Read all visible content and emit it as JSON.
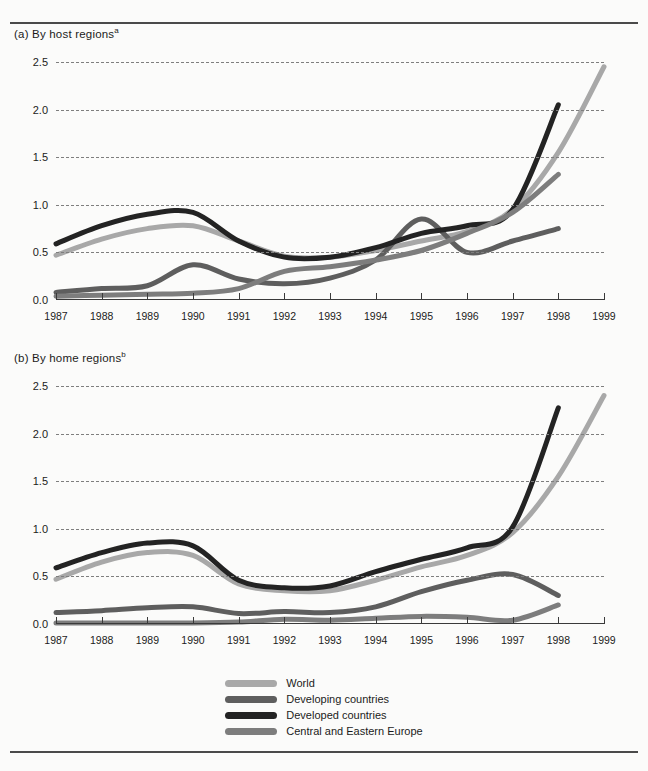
{
  "figure": {
    "background": "#fbfbfa",
    "rule_color": "#4a4a4a"
  },
  "panels": [
    {
      "id": "a",
      "title": "(a) By host regions",
      "note_marker": "a"
    },
    {
      "id": "b",
      "title": "(b) By home regions",
      "note_marker": "b"
    }
  ],
  "legend": {
    "items": [
      {
        "label": "World",
        "color": "#a8a8a8"
      },
      {
        "label": "Developing countries",
        "color": "#5e5e5e"
      },
      {
        "label": "Developed countries",
        "color": "#232323"
      },
      {
        "label": "Central and Eastern Europe",
        "color": "#7d7d7d"
      }
    ]
  },
  "chart_data": [
    {
      "type": "line",
      "panel": "a",
      "title": "(a) By host regions",
      "xlabel": "",
      "ylabel": "",
      "x": [
        1987,
        1988,
        1989,
        1990,
        1991,
        1992,
        1993,
        1994,
        1995,
        1996,
        1997,
        1998,
        1999
      ],
      "xtick_labels": [
        "1987",
        "1988",
        "1989",
        "1990",
        "1991",
        "1992",
        "1993",
        "1994",
        "1995",
        "1996",
        "1997",
        "1998",
        "1999"
      ],
      "ytick_labels": [
        "0.0",
        "0.5",
        "1.0",
        "1.5",
        "2.0",
        "2.5"
      ],
      "yticks": [
        0.0,
        0.5,
        1.0,
        1.5,
        2.0,
        2.5
      ],
      "ylim": [
        0.0,
        2.5
      ],
      "xlim": [
        1987,
        1999
      ],
      "grid": true,
      "legend_position": "bottom-center",
      "series": [
        {
          "name": "World",
          "color": "#a8a8a8",
          "x": [
            1987,
            1988,
            1989,
            1990,
            1991,
            1992,
            1993,
            1994,
            1995,
            1996,
            1997,
            1998,
            1999
          ],
          "values": [
            0.47,
            0.64,
            0.75,
            0.78,
            0.62,
            0.46,
            0.45,
            0.52,
            0.62,
            0.72,
            0.95,
            1.55,
            2.45
          ]
        },
        {
          "name": "Developing countries",
          "color": "#5e5e5e",
          "x": [
            1987,
            1988,
            1989,
            1990,
            1991,
            1992,
            1993,
            1994,
            1995,
            1996,
            1997,
            1998
          ],
          "values": [
            0.08,
            0.12,
            0.15,
            0.37,
            0.22,
            0.17,
            0.23,
            0.42,
            0.85,
            0.5,
            0.62,
            0.75
          ]
        },
        {
          "name": "Developed countries",
          "color": "#232323",
          "x": [
            1987,
            1988,
            1989,
            1990,
            1991,
            1992,
            1993,
            1994,
            1995,
            1996,
            1997,
            1998
          ],
          "values": [
            0.59,
            0.78,
            0.9,
            0.92,
            0.62,
            0.45,
            0.45,
            0.55,
            0.7,
            0.78,
            0.95,
            2.05
          ]
        },
        {
          "name": "Central and Eastern Europe",
          "color": "#7d7d7d",
          "x": [
            1987,
            1988,
            1989,
            1990,
            1991,
            1992,
            1993,
            1994,
            1995,
            1996,
            1997,
            1998
          ],
          "values": [
            0.04,
            0.05,
            0.06,
            0.07,
            0.12,
            0.3,
            0.35,
            0.42,
            0.52,
            0.7,
            0.92,
            1.32
          ]
        }
      ]
    },
    {
      "type": "line",
      "panel": "b",
      "title": "(b) By home regions",
      "xlabel": "",
      "ylabel": "",
      "x": [
        1987,
        1988,
        1989,
        1990,
        1991,
        1992,
        1993,
        1994,
        1995,
        1996,
        1997,
        1998,
        1999
      ],
      "xtick_labels": [
        "1987",
        "1988",
        "1989",
        "1990",
        "1991",
        "1992",
        "1993",
        "1994",
        "1995",
        "1996",
        "1997",
        "1998",
        "1999"
      ],
      "ytick_labels": [
        "0.0",
        "0.5",
        "1.0",
        "1.5",
        "2.0",
        "2.5"
      ],
      "yticks": [
        0.0,
        0.5,
        1.0,
        1.5,
        2.0,
        2.5
      ],
      "ylim": [
        0.0,
        2.5
      ],
      "xlim": [
        1987,
        1999
      ],
      "grid": true,
      "legend_position": "bottom-center",
      "series": [
        {
          "name": "World",
          "color": "#a8a8a8",
          "x": [
            1987,
            1988,
            1989,
            1990,
            1991,
            1992,
            1993,
            1994,
            1995,
            1996,
            1997,
            1998,
            1999
          ],
          "values": [
            0.47,
            0.65,
            0.75,
            0.72,
            0.42,
            0.35,
            0.35,
            0.46,
            0.6,
            0.72,
            0.96,
            1.55,
            2.4
          ]
        },
        {
          "name": "Developing countries",
          "color": "#5e5e5e",
          "x": [
            1987,
            1988,
            1989,
            1990,
            1991,
            1992,
            1993,
            1994,
            1995,
            1996,
            1997,
            1998
          ],
          "values": [
            0.12,
            0.14,
            0.17,
            0.18,
            0.11,
            0.13,
            0.12,
            0.18,
            0.34,
            0.46,
            0.52,
            0.3
          ]
        },
        {
          "name": "Developed countries",
          "color": "#232323",
          "x": [
            1987,
            1988,
            1989,
            1990,
            1991,
            1992,
            1993,
            1994,
            1995,
            1996,
            1997,
            1998
          ],
          "values": [
            0.59,
            0.75,
            0.85,
            0.82,
            0.46,
            0.38,
            0.4,
            0.55,
            0.68,
            0.8,
            1.02,
            2.27
          ]
        },
        {
          "name": "Central and Eastern Europe",
          "color": "#7d7d7d",
          "x": [
            1987,
            1988,
            1989,
            1990,
            1991,
            1992,
            1993,
            1994,
            1995,
            1996,
            1997,
            1998
          ],
          "values": [
            0.01,
            0.01,
            0.01,
            0.01,
            0.02,
            0.05,
            0.04,
            0.06,
            0.08,
            0.07,
            0.04,
            0.2
          ]
        }
      ]
    }
  ]
}
